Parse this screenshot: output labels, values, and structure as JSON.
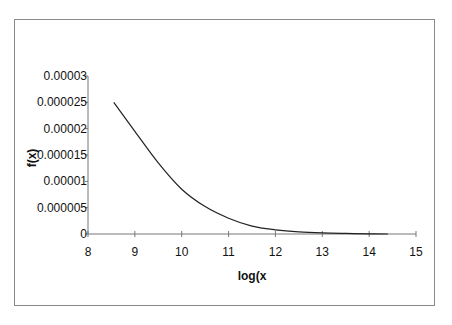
{
  "chart_data": {
    "type": "line",
    "title": "",
    "xlabel": "log(x",
    "ylabel": "f(x)",
    "xlim": [
      8,
      15
    ],
    "ylim": [
      0,
      3e-05
    ],
    "x_ticks": [
      "8",
      "9",
      "10",
      "11",
      "12",
      "13",
      "14",
      "15"
    ],
    "y_ticks": [
      "0",
      "0.000005",
      "0.00001",
      "0.000015",
      "0.00002",
      "0.000025",
      "0.00003"
    ],
    "grid": false,
    "legend": null,
    "series": [
      {
        "name": "f(x)",
        "color": "#222222",
        "x": [
          8.55,
          9.0,
          9.5,
          10.0,
          10.5,
          11.0,
          11.5,
          12.0,
          12.5,
          13.0,
          13.5,
          14.0,
          14.4
        ],
        "y": [
          2.5e-05,
          1.95e-05,
          1.35e-05,
          8.5e-06,
          5.2e-06,
          3e-06,
          1.5e-06,
          8e-07,
          4e-07,
          2e-07,
          1e-07,
          3e-08,
          0.0
        ]
      }
    ]
  }
}
